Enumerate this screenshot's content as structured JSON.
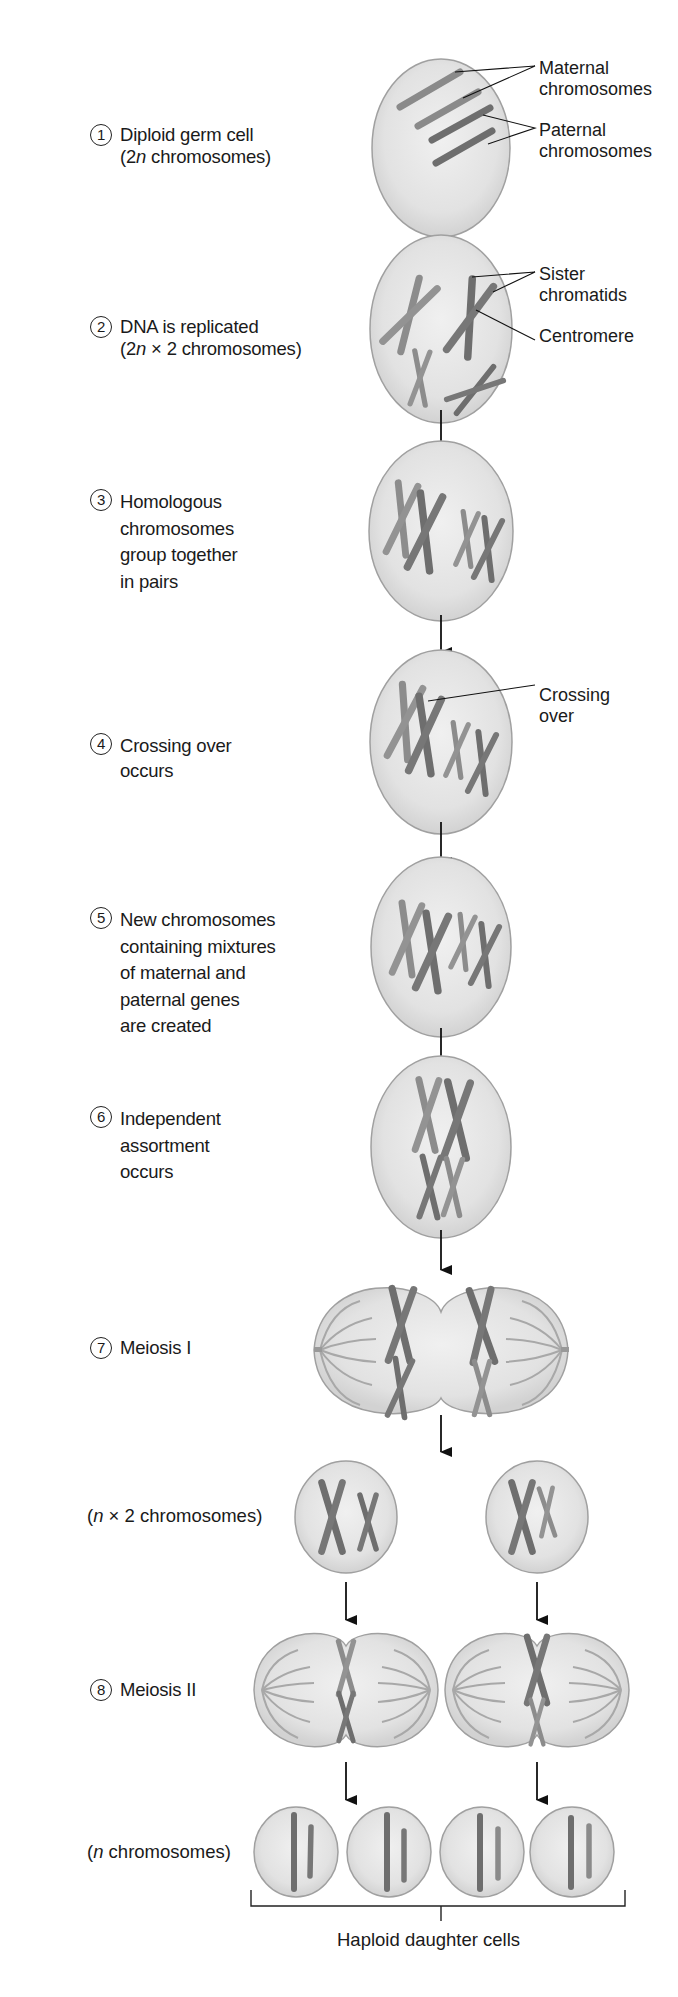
{
  "steps": [
    {
      "number": "1",
      "text": "Diploid germ cell",
      "text2_pre": "(2",
      "text2_italic": "n",
      "text2_post": " chromosomes)"
    },
    {
      "number": "2",
      "text": "DNA is replicated",
      "text2_pre": "(2",
      "text2_italic": "n",
      "text2_post": " × 2 chromosomes)"
    },
    {
      "number": "3",
      "text": "Homologous\nchromosomes\ngroup together\nin pairs"
    },
    {
      "number": "4",
      "text": "Crossing over\noccurs"
    },
    {
      "number": "5",
      "text": "New chromosomes\ncontaining mixtures\nof maternal and\npaternal genes\nare created"
    },
    {
      "number": "6",
      "text": "Independent\nassortment\noccurs"
    },
    {
      "number": "7",
      "text": "Meiosis I"
    },
    {
      "number": "8",
      "text": "Meiosis II"
    }
  ],
  "intermediate_labels": {
    "n_times_2": {
      "pre": "(",
      "italic": "n",
      "post": " × 2 chromosomes)"
    },
    "n_chromosomes": {
      "pre": "(",
      "italic": "n",
      "post": " chromosomes)"
    }
  },
  "callouts": {
    "maternal": "Maternal\nchromosomes",
    "paternal": "Paternal\nchromosomes",
    "sister_chromatids": "Sister\nchromatids",
    "centromere": "Centromere",
    "crossing_over": "Crossing\nover"
  },
  "bracket_label": "Haploid daughter cells",
  "colors": {
    "cell_fill": "#e4e4e4",
    "cell_edge": "#9a9a9a",
    "chromosome_dark": "#6f6f6f",
    "chromosome_light": "#8f8f8f",
    "spindle": "#a5a5a5",
    "text": "#1a1a1a"
  }
}
